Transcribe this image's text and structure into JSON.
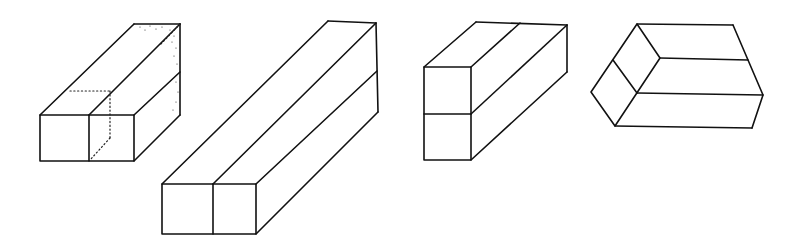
{
  "figure": {
    "stroke_color": "#111111",
    "background_color": "#ffffff",
    "shapes": [
      {
        "id": "prism-1",
        "label": "2x1x2 prism with hidden edges shown dotted",
        "front_cells": 2,
        "orientation": "horizontal-front, split vertically",
        "has_hidden_edges": true
      },
      {
        "id": "prism-2",
        "label": "long 2-cell prism extending diagonally back",
        "front_cells": 2,
        "orientation": "horizontal-front, split vertically",
        "has_hidden_edges": false
      },
      {
        "id": "prism-3",
        "label": "stacked 2-cell prism extending diagonally back",
        "front_cells": 2,
        "orientation": "vertical-front, split horizontally",
        "has_hidden_edges": false
      },
      {
        "id": "prism-4",
        "label": "prism viewed from above-left, rhombic end faces",
        "front_cells": 2,
        "orientation": "tilted, end face split diagonally",
        "has_hidden_edges": false
      }
    ]
  }
}
